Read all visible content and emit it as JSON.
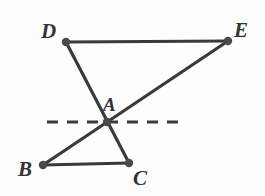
{
  "figure": {
    "width": 265,
    "height": 196,
    "background_color": "#fdfdfd",
    "stroke_color": "#3a3a3a",
    "label_color": "#333333",
    "vertex_fill_color": "#4a4a4a",
    "solid_stroke_width": 3.2,
    "dashed_stroke_width": 3.2,
    "vertex_radius": 4.2,
    "points": [
      {
        "id": "D",
        "label": "D",
        "x": 66,
        "y": 42,
        "label_x": 41,
        "label_y": 21
      },
      {
        "id": "E",
        "label": "E",
        "x": 228,
        "y": 41,
        "label_x": 234,
        "label_y": 20
      },
      {
        "id": "A",
        "label": "A",
        "x": 107,
        "y": 122,
        "label_x": 103,
        "label_y": 95
      },
      {
        "id": "B",
        "label": "B",
        "x": 43,
        "y": 165,
        "label_x": 18,
        "label_y": 159
      },
      {
        "id": "C",
        "label": "C",
        "x": 129,
        "y": 163,
        "label_x": 133,
        "label_y": 168
      }
    ],
    "segments": [
      {
        "id": "DE",
        "from": "D",
        "to": "E",
        "style": "solid"
      },
      {
        "id": "DC",
        "from": "D",
        "to": "C",
        "style": "solid",
        "note": "passes through A"
      },
      {
        "id": "BE",
        "from": "B",
        "to": "E",
        "style": "solid",
        "note": "passes through A"
      },
      {
        "id": "BC",
        "from": "B",
        "to": "C",
        "style": "solid"
      }
    ],
    "dashed_line": {
      "id": "horizontal-dashed-line",
      "x1": 47,
      "x2": 180,
      "y": 122,
      "dash_pattern": "11 9",
      "note": "horizontal dashed line through vertex A"
    }
  }
}
